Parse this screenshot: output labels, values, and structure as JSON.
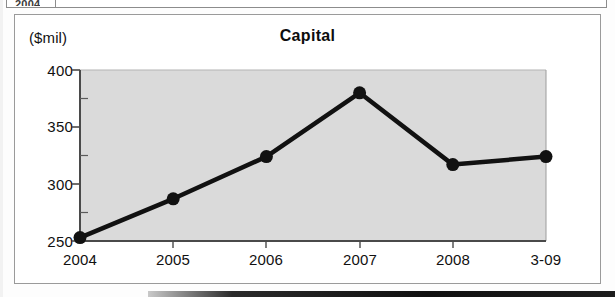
{
  "document": {
    "type": "scanned-financial-report-excerpt",
    "table_remnant": {
      "visible": true,
      "cells": [
        "2004",
        "...",
        "",
        ""
      ],
      "note": "top table row clipped by the scan crop"
    }
  },
  "chart_data": {
    "type": "line",
    "title": "Capital",
    "unit_label": "($mil)",
    "xlabel": "",
    "ylabel": "",
    "categories": [
      "2004",
      "2005",
      "2006",
      "2007",
      "2008",
      "3-09"
    ],
    "values": [
      253,
      287,
      324,
      380,
      317,
      324
    ],
    "series": [
      {
        "name": "Capital",
        "values": [
          253,
          287,
          324,
          380,
          317,
          324
        ]
      }
    ],
    "ylim": [
      250,
      400
    ],
    "y_ticks": [
      "250",
      "300",
      "350",
      "400"
    ],
    "y_tick_values": [
      250,
      300,
      350,
      400
    ],
    "y_minor_tick_values": [
      275,
      325,
      375
    ],
    "x_ticks": [
      "2004",
      "2005",
      "2006",
      "2007",
      "2008",
      "3-09"
    ],
    "grid": false,
    "legend": "none",
    "marker": "filled-circle",
    "colors": {
      "line": "#111111",
      "marker": "#111111",
      "plot_background": "#d8d8d8",
      "axis": "#555555",
      "frame": "#9a9a9a",
      "text": "#111111"
    }
  }
}
